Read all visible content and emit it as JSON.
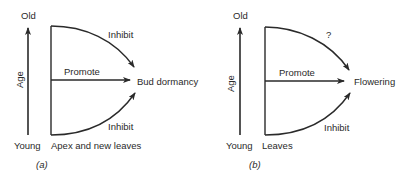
{
  "panels": [
    {
      "id": "a",
      "caption": "(a)",
      "axis": {
        "label": "Age",
        "top": "Old",
        "bottom": "Young"
      },
      "source_label": "Apex and new leaves",
      "target_label": "Bud dormancy",
      "top_arrow_label": "Inhibit",
      "middle_arrow_label": "Promote",
      "bottom_arrow_label": "Inhibit"
    },
    {
      "id": "b",
      "caption": "(b)",
      "axis": {
        "label": "Age",
        "top": "Old",
        "bottom": "Young"
      },
      "source_label": "Leaves",
      "target_label": "Flowering",
      "top_arrow_label": "?",
      "middle_arrow_label": "Promote",
      "bottom_arrow_label": "Inhibit"
    }
  ],
  "colors": {
    "ink": "#2a2a2a",
    "background": "#ffffff"
  }
}
